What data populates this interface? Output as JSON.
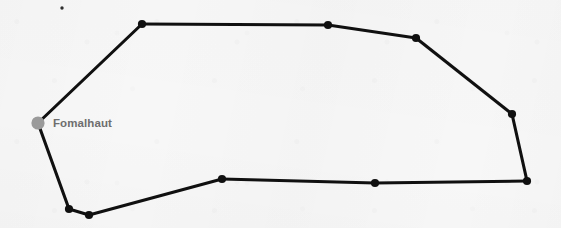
{
  "chart": {
    "width": 561,
    "height": 228,
    "background_color": "#f7f7f7",
    "line_color": "#101010",
    "line_width": 3.1,
    "star_color": "#101010",
    "star_radius": 4.1,
    "bright_star_color": "#9a9a9a",
    "bright_star_radius": 6.6,
    "faint_star_color": "#2e2e2e",
    "faint_star_radius": 1.7
  },
  "stars": [
    {
      "id": "fomalhaut",
      "label": "Fomalhaut",
      "x": 38,
      "y": 123,
      "kind": "bright"
    },
    {
      "id": "theta-psa",
      "label": "",
      "x": 142,
      "y": 24,
      "kind": "normal"
    },
    {
      "id": "iota-psa",
      "label": "",
      "x": 328,
      "y": 25,
      "kind": "normal"
    },
    {
      "id": "mu-psa",
      "label": "",
      "x": 416,
      "y": 38,
      "kind": "normal"
    },
    {
      "id": "tau-psa",
      "label": "",
      "x": 512,
      "y": 114,
      "kind": "normal"
    },
    {
      "id": "upsilon-psa",
      "label": "",
      "x": 527,
      "y": 181,
      "kind": "normal"
    },
    {
      "id": "delta-psa",
      "label": "",
      "x": 375,
      "y": 183,
      "kind": "normal"
    },
    {
      "id": "beta-psa",
      "label": "",
      "x": 222,
      "y": 179,
      "kind": "normal"
    },
    {
      "id": "gamma-psa",
      "label": "",
      "x": 89,
      "y": 215,
      "kind": "normal"
    },
    {
      "id": "epsilon-psa",
      "label": "",
      "x": 69,
      "y": 209,
      "kind": "normal"
    },
    {
      "id": "eta-psa",
      "label": "",
      "x": 62,
      "y": 8,
      "kind": "faint"
    }
  ],
  "lines": [
    {
      "from": "fomalhaut",
      "to": "theta-psa"
    },
    {
      "from": "theta-psa",
      "to": "iota-psa"
    },
    {
      "from": "iota-psa",
      "to": "mu-psa"
    },
    {
      "from": "mu-psa",
      "to": "tau-psa"
    },
    {
      "from": "tau-psa",
      "to": "upsilon-psa"
    },
    {
      "from": "upsilon-psa",
      "to": "delta-psa"
    },
    {
      "from": "delta-psa",
      "to": "beta-psa"
    },
    {
      "from": "beta-psa",
      "to": "gamma-psa"
    },
    {
      "from": "gamma-psa",
      "to": "epsilon-psa"
    },
    {
      "from": "epsilon-psa",
      "to": "fomalhaut"
    }
  ],
  "labels": [
    {
      "id": "fomalhaut-label",
      "text": "Fomalhaut",
      "x": 53,
      "y": 117,
      "color": "#6e6e6e",
      "font_size": 11.5
    }
  ]
}
